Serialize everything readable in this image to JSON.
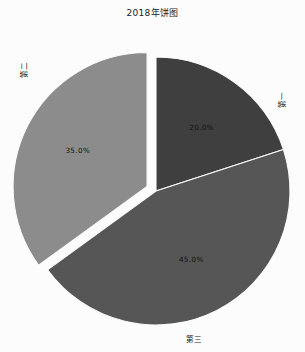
{
  "chart": {
    "title": "2018年饼图"
  },
  "chart_data": {
    "type": "pie",
    "title": "2018年饼图",
    "xlabel": "",
    "ylabel": "",
    "categories": [
      "第一",
      "第三",
      "第二"
    ],
    "values": [
      20.0,
      45.0,
      35.0
    ],
    "labels_text": [
      "20.0%",
      "45.0%",
      "35.0%"
    ],
    "colors": [
      "#3f3f3f",
      "#565656",
      "#8c8c8c"
    ],
    "start_angle_deg": 90,
    "direction": "clockwise",
    "explode": [
      0.0,
      0.0,
      0.075
    ],
    "autopct_format": "%.1f%%",
    "legend": "none",
    "grid": false,
    "slice_edge_color": "#fcfcfc",
    "background_color": "#fcfcfc",
    "series": [
      {
        "name": "第一",
        "value": 20.0,
        "percent_label": "20.0%",
        "color": "#3f3f3f",
        "exploded": false
      },
      {
        "name": "第三",
        "value": 45.0,
        "percent_label": "45.0%",
        "color": "#565656",
        "exploded": false
      },
      {
        "name": "第二",
        "value": 35.0,
        "percent_label": "35.0%",
        "color": "#8c8c8c",
        "exploded": true
      }
    ]
  },
  "labels": {
    "first": "第一",
    "second": "第二",
    "third": "第三",
    "pct_first": "20.0%",
    "pct_second": "35.0%",
    "pct_third": "45.0%"
  }
}
